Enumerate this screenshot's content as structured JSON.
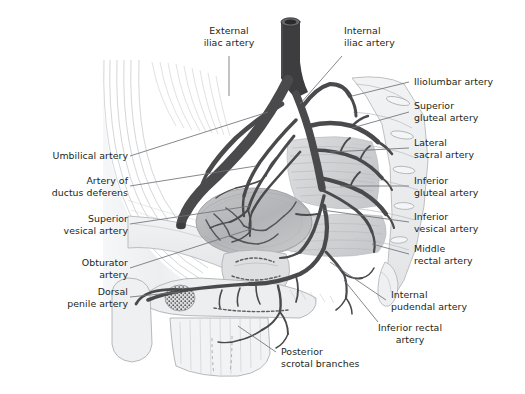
{
  "figure": {
    "type": "anatomical-illustration",
    "style": "grayscale line and tone drawing",
    "background_color": "#ffffff",
    "text_color": "#231f20",
    "leader_line_color": "#6f7277",
    "artery_color": "#4a4a4d",
    "bone_color": "#e9eaec",
    "bladder_color": "#b9bbbd",
    "muscle_color": "#cfd1d4"
  },
  "labels": [
    {
      "id": "external-iliac-artery",
      "text": "External\niliac artery",
      "align": "center"
    },
    {
      "id": "internal-iliac-artery",
      "text": "Internal\niliac artery",
      "align": "left"
    },
    {
      "id": "iliolumbar-artery",
      "text": "Iliolumbar artery",
      "align": "left"
    },
    {
      "id": "superior-gluteal-artery",
      "text": "Superior\ngluteal artery",
      "align": "left"
    },
    {
      "id": "lateral-sacral-artery",
      "text": "Lateral\nsacral artery",
      "align": "left"
    },
    {
      "id": "inferior-gluteal-artery",
      "text": "Inferior\ngluteal artery",
      "align": "left"
    },
    {
      "id": "inferior-vesical-artery",
      "text": "Inferior\nvesical artery",
      "align": "left"
    },
    {
      "id": "middle-rectal-artery",
      "text": "Middle\nrectal artery",
      "align": "left"
    },
    {
      "id": "internal-pudendal-artery",
      "text": "Internal\npudendal artery",
      "align": "left"
    },
    {
      "id": "inferior-rectal-artery",
      "text": "Inferior rectal\nartery",
      "align": "center"
    },
    {
      "id": "posterior-scrotal-branches",
      "text": "Posterior\nscrotal branches",
      "align": "left"
    },
    {
      "id": "dorsal-penile-artery",
      "text": "Dorsal\npenile artery",
      "align": "right"
    },
    {
      "id": "obturator-artery",
      "text": "Obturator\nartery",
      "align": "right"
    },
    {
      "id": "superior-vesical-artery",
      "text": "Superior\nvesical artery",
      "align": "right"
    },
    {
      "id": "artery-of-ductus-deferens",
      "text": "Artery of\nductus deferens",
      "align": "right"
    },
    {
      "id": "umbilical-artery",
      "text": "Umbilical artery",
      "align": "right"
    }
  ]
}
